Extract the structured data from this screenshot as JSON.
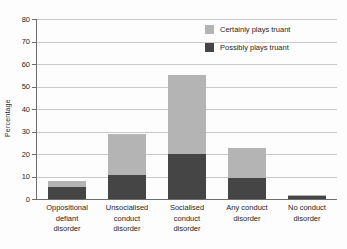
{
  "chart_data": {
    "type": "bar",
    "subtype": "stacked-bar",
    "title": "",
    "xlabel": "",
    "ylabel": "Percentage",
    "ylim": [
      0,
      80
    ],
    "yticks": [
      0,
      10,
      20,
      30,
      40,
      50,
      60,
      70,
      80
    ],
    "grid": true,
    "legend_position": "top-right",
    "categories": [
      "Oppositional defiant disorder",
      "Unsocialised conduct disorder",
      "Socialised conduct disorder",
      "Any conduct disorder",
      "No conduct disorder"
    ],
    "category_lines": [
      [
        "Oppositional",
        "defiant",
        "disorder"
      ],
      [
        "Unsocialised",
        "conduct",
        "disorder"
      ],
      [
        "Socialised",
        "conduct",
        "disorder"
      ],
      [
        "Any conduct",
        "disorder"
      ],
      [
        "No conduct",
        "disorder"
      ]
    ],
    "series": [
      {
        "name": "Possibly plays truant",
        "color": "#454545",
        "values": [
          5.5,
          10.5,
          20,
          9.5,
          1.5
        ]
      },
      {
        "name": "Certainly plays truant",
        "color": "#b4b4b4",
        "values": [
          2.5,
          18.5,
          35,
          13,
          0.5
        ]
      }
    ],
    "totals": [
      8,
      29,
      55,
      22.5,
      2
    ]
  },
  "axis": {
    "y_title": "Percentage",
    "y_tick_labels": [
      "0",
      "10",
      "20",
      "30",
      "40",
      "50",
      "60",
      "70",
      "80"
    ]
  },
  "legend": {
    "items": [
      {
        "label": "Certainly plays truant",
        "color": "#b4b4b4"
      },
      {
        "label": "Possibly plays truant",
        "color": "#454545"
      }
    ]
  }
}
